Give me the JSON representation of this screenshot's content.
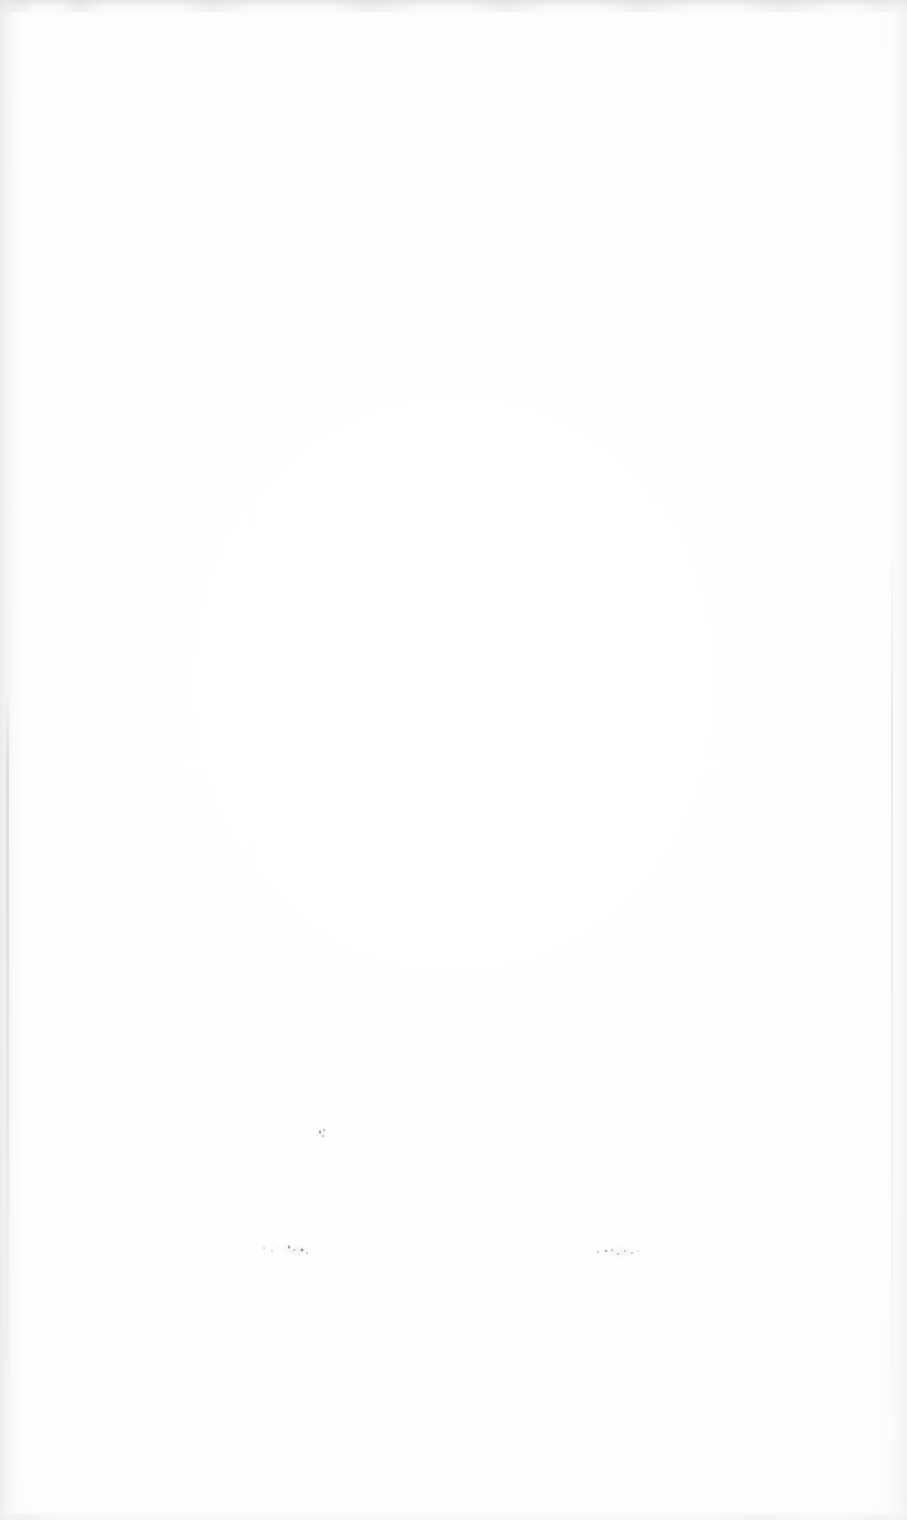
{
  "document": {
    "kind": "scanned-page",
    "page_state": "blank",
    "width": 907,
    "height": 1520,
    "paper_color": "#fefefe",
    "ink_color": "#2d2d32"
  },
  "artifacts": {
    "edges": {
      "top_label": "",
      "left_label": "",
      "right_label": "",
      "bottom_label": ""
    },
    "marks": [
      {
        "id": "speck-upper",
        "label": "",
        "x": 312,
        "y": 1124
      },
      {
        "id": "speck-tiny",
        "label": "",
        "x": 364,
        "y": 1134
      },
      {
        "id": "smudge-left",
        "label": "",
        "x": 258,
        "y": 1237
      },
      {
        "id": "smudge-right",
        "label": "",
        "x": 591,
        "y": 1240
      }
    ]
  },
  "clipped_text": {
    "left_fragment": "",
    "right_fragment": ""
  }
}
